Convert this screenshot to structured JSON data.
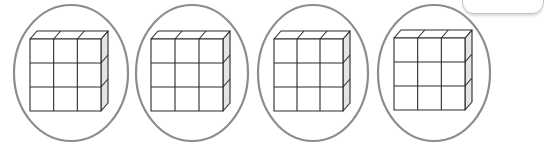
{
  "diagram": {
    "groups": [
      {
        "id": 1,
        "ellipse": {
          "cx": 71,
          "cy": 73,
          "rx": 57,
          "ry": 68
        },
        "block": {
          "x": 30,
          "y": 39,
          "w": 71,
          "h": 72,
          "rows": 3,
          "cols": 3,
          "depth_dx": 7,
          "depth_dy": -8
        }
      },
      {
        "id": 2,
        "ellipse": {
          "cx": 192,
          "cy": 73,
          "rx": 56,
          "ry": 68
        },
        "block": {
          "x": 151,
          "y": 39,
          "w": 72,
          "h": 72,
          "rows": 3,
          "cols": 3,
          "depth_dx": 7,
          "depth_dy": -8
        }
      },
      {
        "id": 3,
        "ellipse": {
          "cx": 313,
          "cy": 73,
          "rx": 55,
          "ry": 68
        },
        "block": {
          "x": 274,
          "y": 39,
          "w": 69,
          "h": 72,
          "rows": 3,
          "cols": 3,
          "depth_dx": 7,
          "depth_dy": -8
        }
      },
      {
        "id": 4,
        "ellipse": {
          "cx": 434,
          "cy": 73,
          "rx": 56,
          "ry": 68
        },
        "block": {
          "x": 394,
          "y": 38,
          "w": 71,
          "h": 72,
          "rows": 3,
          "cols": 3,
          "depth_dx": 7,
          "depth_dy": -8
        }
      }
    ],
    "cubes_per_block": 9,
    "colors": {
      "ellipse_stroke": "#8c8c8c",
      "cube_stroke": "#2a2a2a",
      "cube_front_fill": "#ffffff",
      "cube_top_fill": "#ffffff",
      "cube_side_fill": "#e4e4e4",
      "background": "#ffffff"
    }
  }
}
